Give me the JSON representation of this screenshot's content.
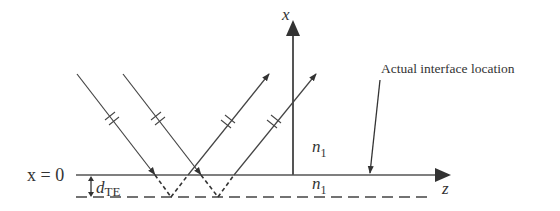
{
  "diagram": {
    "axis_x_label": "x",
    "axis_z_label": "z",
    "interface_label": "x = 0",
    "depth_label_main": "d",
    "depth_label_sub": "TE",
    "medium_upper_label_main": "n",
    "medium_upper_label_sub": "1",
    "medium_lower_label_main": "n",
    "medium_lower_label_sub": "1",
    "annotation": "Actual interface location",
    "colors": {
      "line": "#333333",
      "background": "#ffffff"
    }
  }
}
